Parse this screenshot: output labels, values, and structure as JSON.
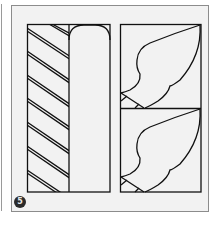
{
  "figure": {
    "step_number": "5",
    "colors": {
      "line": "#111111",
      "panel_bg": "#f2f2f2",
      "panel_border": "#8c8c8c",
      "badge_bg": "#2b2b2b"
    },
    "panels": [
      {
        "name": "left-pattern",
        "description": "diagonal double-line stripes beside rounded arch"
      },
      {
        "name": "right-pattern",
        "description": "two stacked squares each with wing/leaf curve"
      }
    ]
  }
}
